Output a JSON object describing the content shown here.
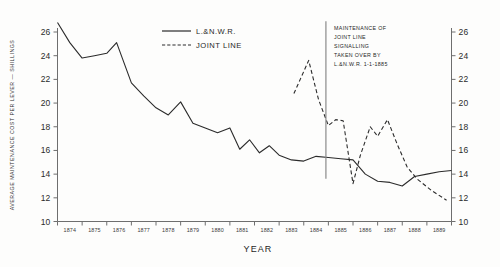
{
  "chart_data": {
    "type": "line",
    "title": "",
    "xlabel": "YEAR",
    "ylabel": "AVERAGE MAINTENANCE COST PER LEVER — SHILLINGS",
    "ylabel_right": "",
    "ylim": [
      10,
      26
    ],
    "y_ticks": [
      10,
      12,
      14,
      16,
      18,
      20,
      22,
      24,
      26
    ],
    "y_ticks_right": [
      10,
      12,
      14,
      16,
      18,
      20,
      22,
      24,
      26
    ],
    "grid": false,
    "legend_position": "top-center",
    "categories": [
      "1874",
      "1875",
      "1876",
      "1877",
      "1878",
      "1879",
      "1880",
      "1881",
      "1882",
      "1883",
      "1884",
      "1885",
      "1886",
      "1887",
      "1888",
      "1889"
    ],
    "x": [
      1874,
      1875,
      1876,
      1877,
      1878,
      1879,
      1880,
      1881,
      1882,
      1883,
      1884,
      1885,
      1886,
      1887,
      1888,
      1889
    ],
    "series": [
      {
        "name": "L.&N.W.R.",
        "style": "solid",
        "x": [
          1874.0,
          1874.5,
          1875.0,
          1875.5,
          1876.0,
          1876.4,
          1877.0,
          1877.5,
          1878.0,
          1878.5,
          1879.0,
          1879.5,
          1880.0,
          1880.5,
          1881.0,
          1881.4,
          1881.8,
          1882.2,
          1882.6,
          1883.0,
          1883.5,
          1884.0,
          1884.5,
          1885.0,
          1885.5,
          1886.0,
          1886.5,
          1887.0,
          1887.5,
          1888.0,
          1888.5,
          1889.0,
          1889.5,
          1890.0
        ],
        "values": [
          26.8,
          25.1,
          23.8,
          24.0,
          24.2,
          25.1,
          21.7,
          20.6,
          19.6,
          19.0,
          20.1,
          18.3,
          17.9,
          17.5,
          17.9,
          16.1,
          16.9,
          15.8,
          16.4,
          15.6,
          15.2,
          15.1,
          15.5,
          15.4,
          15.3,
          15.2,
          14.0,
          13.4,
          13.3,
          13.0,
          13.8,
          14.0,
          14.2,
          14.3
        ]
      },
      {
        "name": "JOINT LINE",
        "style": "dashed",
        "x": [
          1883.6,
          1884.2,
          1884.6,
          1885.0,
          1885.3,
          1885.6,
          1886.0,
          1886.3,
          1886.7,
          1887.0,
          1887.4,
          1887.8,
          1888.2,
          1888.6,
          1889.2,
          1889.8
        ],
        "values": [
          20.8,
          23.6,
          20.3,
          18.1,
          18.6,
          18.5,
          13.2,
          15.6,
          18.0,
          17.2,
          18.6,
          16.5,
          14.6,
          13.6,
          12.6,
          11.8
        ]
      }
    ],
    "annotations": [
      {
        "id": "takeover-note",
        "lines": [
          "MAINTENANCE OF",
          "JOINT LINE",
          "SIGNALLING",
          "TAKEN OVER BY",
          "L.&N.W.R.  1-1-1885"
        ],
        "marker_x": 1884.9,
        "marker_from": 26.9,
        "marker_to": 13.6
      }
    ]
  },
  "legend": {
    "entries": [
      {
        "label": "L.&N.W.R.",
        "style": "solid"
      },
      {
        "label": "JOINT  LINE",
        "style": "dashed"
      }
    ]
  },
  "axes": {
    "x_title": "YEAR",
    "y_title": "AVERAGE MAINTENANCE COST PER LEVER — SHILLINGS",
    "y_tick_labels": [
      "26",
      "24",
      "22",
      "20",
      "18",
      "16",
      "14",
      "12",
      "10"
    ],
    "y_tick_labels_right": [
      "26",
      "24",
      "22",
      "20",
      "18",
      "16",
      "14",
      "12",
      "10"
    ],
    "x_tick_labels": [
      "1874",
      "1875",
      "1876",
      "1877",
      "1878",
      "1879",
      "1880",
      "1881",
      "1882",
      "1883",
      "1884",
      "1885",
      "1886",
      "1887",
      "1888",
      "1889"
    ]
  },
  "annotation": {
    "line1": "MAINTENANCE OF",
    "line2": "JOINT LINE",
    "line3": "SIGNALLING",
    "line4": "TAKEN OVER BY",
    "line5": "L.&N.W.R.  1-1-1885"
  },
  "colors": {
    "ink": "#2b2b2b",
    "axis": "#6e6e6e",
    "background": "#fdfdfc",
    "marker": "#8a8a8a"
  }
}
